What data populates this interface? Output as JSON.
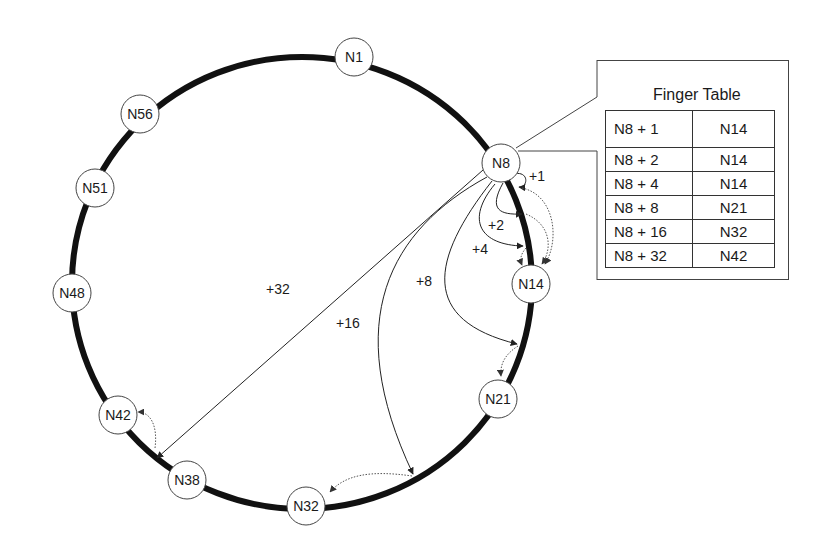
{
  "ring": {
    "nodes": [
      {
        "id": "N1",
        "label": "N1"
      },
      {
        "id": "N8",
        "label": "N8"
      },
      {
        "id": "N14",
        "label": "N14"
      },
      {
        "id": "N21",
        "label": "N21"
      },
      {
        "id": "N32",
        "label": "N32"
      },
      {
        "id": "N38",
        "label": "N38"
      },
      {
        "id": "N42",
        "label": "N42"
      },
      {
        "id": "N48",
        "label": "N48"
      },
      {
        "id": "N51",
        "label": "N51"
      },
      {
        "id": "N56",
        "label": "N56"
      }
    ]
  },
  "fingers": [
    {
      "label": "+1"
    },
    {
      "label": "+2"
    },
    {
      "label": "+4"
    },
    {
      "label": "+8"
    },
    {
      "label": "+16"
    },
    {
      "label": "+32"
    }
  ],
  "finger_table": {
    "title": "Finger Table",
    "rows": [
      {
        "start": "N8 + 1",
        "successor": "N14"
      },
      {
        "start": "N8 + 2",
        "successor": "N14"
      },
      {
        "start": "N8 + 4",
        "successor": "N14"
      },
      {
        "start": "N8 + 8",
        "successor": "N21"
      },
      {
        "start": "N8 + 16",
        "successor": "N32"
      },
      {
        "start": "N8 + 32",
        "successor": "N42"
      }
    ]
  }
}
